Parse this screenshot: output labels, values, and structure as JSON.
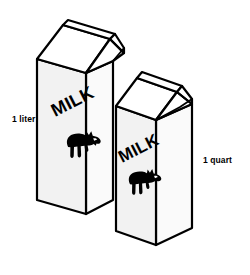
{
  "figure": {
    "background_color": "#FFFFFF",
    "line_color": "#000000",
    "labels": {
      "left_label": "1 liter",
      "right_label": "1 quart"
    }
  },
  "cartons": [
    {
      "id": "left-carton",
      "name": "liter-carton",
      "capacity_label": "1 liter",
      "brand_text": "MILK",
      "logo": "cow-icon",
      "front_face_color": "#F2F2F2",
      "side_face_color": "#FAFAFA",
      "gable_face_color": "#FFFFFF",
      "outline_color": "#000000",
      "milk_text_rotation_deg": -27,
      "z_order": "front-left"
    },
    {
      "id": "right-carton",
      "name": "quart-carton",
      "capacity_label": "1 quart",
      "brand_text": "MILK",
      "logo": "cow-icon",
      "front_face_color": "#F2F2F2",
      "side_face_color": "#FAFAFA",
      "gable_face_color": "#FFFFFF",
      "outline_color": "#000000",
      "milk_text_rotation_deg": -27,
      "z_order": "front-right"
    }
  ]
}
